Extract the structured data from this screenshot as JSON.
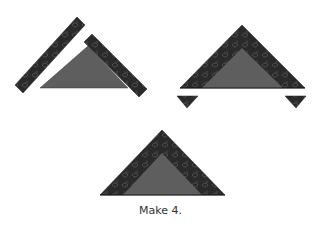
{
  "caption": "Make 4.",
  "colors": {
    "fabric_dark": "#2a2a2a",
    "fabric_pattern": "#555555",
    "center_gray": "#5e5e5e",
    "background": "#ffffff"
  },
  "figures": [
    {
      "name": "step-strips-separate",
      "description": "Two border strips separated from center triangle"
    },
    {
      "name": "step-strips-sewn",
      "description": "Strips sewn to triangle with overhang trimmed"
    },
    {
      "name": "step-finished-unit",
      "description": "Finished triangle unit"
    }
  ]
}
